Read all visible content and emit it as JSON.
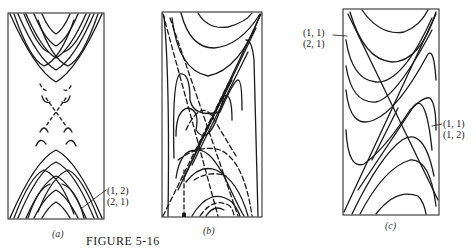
{
  "figure": {
    "title": "FIGURE 5-16",
    "panels": [
      {
        "id": "a",
        "caption": "(a)",
        "annotation": [
          "(1, 2)",
          "(2, 1)"
        ]
      },
      {
        "id": "b",
        "caption": "(b)",
        "annotation": []
      },
      {
        "id": "c",
        "caption": "(c)",
        "annotation_left": [
          "(1, 1)",
          "(2, 1)"
        ],
        "annotation_right": [
          "(1, 1)",
          "(1, 2)"
        ]
      }
    ]
  },
  "colors": {
    "line": "#1a1a1a",
    "background": "#ffffff"
  }
}
